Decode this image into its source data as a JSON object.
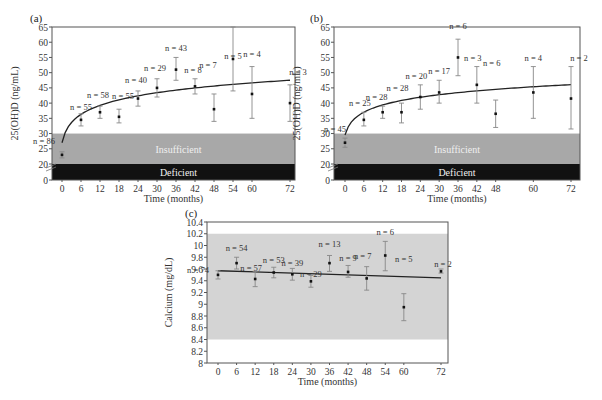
{
  "chart_data": [
    {
      "panel": "(a)",
      "type": "scatter",
      "title": "",
      "xlabel": "Time (months)",
      "ylabel": "25(OH)D (ng/mL)",
      "x_ticks": [
        0,
        6,
        12,
        18,
        24,
        30,
        36,
        42,
        48,
        54,
        60,
        72
      ],
      "y_ticks": [
        0,
        20,
        25,
        30,
        35,
        40,
        45,
        50,
        55,
        60,
        65
      ],
      "ylim": [
        0,
        65
      ],
      "axis_break": "between 0 and 20",
      "zones": [
        {
          "label": "Insufficient",
          "from": 20,
          "to": 30,
          "color": "#a8a8a8"
        },
        {
          "label": "Deficient",
          "from": 0,
          "to": 20,
          "color": "#111111"
        }
      ],
      "points": [
        {
          "x": 0,
          "y": 23,
          "low": 22,
          "high": 24,
          "n": "n = 86"
        },
        {
          "x": 6,
          "y": 34.5,
          "low": 32.5,
          "high": 36.5,
          "n": "n = 55"
        },
        {
          "x": 12,
          "y": 37,
          "low": 35,
          "high": 39,
          "n": "n = 58"
        },
        {
          "x": 18,
          "y": 35.5,
          "low": 33.5,
          "high": 38,
          "n": "n = 55"
        },
        {
          "x": 24,
          "y": 41.5,
          "low": 39,
          "high": 44,
          "n": "n = 40"
        },
        {
          "x": 30,
          "y": 45,
          "low": 42,
          "high": 48,
          "n": "n = 29"
        },
        {
          "x": 36,
          "y": 51,
          "low": 47.5,
          "high": 55,
          "n": "n = 43"
        },
        {
          "x": 42,
          "y": 45.5,
          "low": 43,
          "high": 48,
          "n": "n = 8"
        },
        {
          "x": 48,
          "y": 38,
          "low": 34,
          "high": 43,
          "n": "n = 7"
        },
        {
          "x": 54,
          "y": 54.5,
          "low": 44,
          "high": 65,
          "n": "n = 5"
        },
        {
          "x": 60,
          "y": 43,
          "low": 35,
          "high": 52,
          "n": "n = 4"
        },
        {
          "x": 72,
          "y": 40,
          "low": 34,
          "high": 46,
          "n": "n = 3"
        }
      ],
      "trend": "logarithmic curve from ~27 at 0 months to ~47.5 at 72 months"
    },
    {
      "panel": "(b)",
      "type": "scatter",
      "title": "",
      "xlabel": "Time (months)",
      "ylabel": "25(OH)D (ng/mL)",
      "x_ticks": [
        0,
        6,
        12,
        18,
        24,
        30,
        36,
        42,
        48,
        60,
        72
      ],
      "y_ticks": [
        0,
        20,
        25,
        30,
        35,
        40,
        45,
        50,
        55,
        60,
        65
      ],
      "ylim": [
        0,
        65
      ],
      "axis_break": "between 0 and 20",
      "zones": [
        {
          "label": "Insufficient",
          "from": 20,
          "to": 30,
          "color": "#a8a8a8"
        },
        {
          "label": "Deficient",
          "from": 0,
          "to": 20,
          "color": "#111111"
        }
      ],
      "points": [
        {
          "x": 0,
          "y": 27,
          "low": 25.5,
          "high": 28.5,
          "n": "n = 45"
        },
        {
          "x": 6,
          "y": 34.5,
          "low": 32.5,
          "high": 37,
          "n": "n = 25"
        },
        {
          "x": 12,
          "y": 37,
          "low": 35,
          "high": 39,
          "n": "n = 28"
        },
        {
          "x": 18,
          "y": 37,
          "low": 33.5,
          "high": 40,
          "n": "n = 28"
        },
        {
          "x": 24,
          "y": 42,
          "low": 38,
          "high": 46,
          "n": "n = 20"
        },
        {
          "x": 30,
          "y": 43.5,
          "low": 40,
          "high": 47.5,
          "n": "n = 17"
        },
        {
          "x": 36,
          "y": 55,
          "low": 49,
          "high": 61,
          "n": "n = 6"
        },
        {
          "x": 42,
          "y": 46,
          "low": 40,
          "high": 52,
          "n": "n = 3"
        },
        {
          "x": 48,
          "y": 36.5,
          "low": 32,
          "high": 41,
          "n": "n = 6"
        },
        {
          "x": 60,
          "y": 43.5,
          "low": 35,
          "high": 52,
          "n": "n = 4"
        },
        {
          "x": 72,
          "y": 41.5,
          "low": 31.5,
          "high": 52,
          "n": "n = 2"
        }
      ],
      "trend": "logarithmic curve from ~29.5 at 0 months to ~46 at 72 months"
    },
    {
      "panel": "(c)",
      "type": "scatter",
      "title": "",
      "xlabel": "Time (months)",
      "ylabel": "Calcium (mg/dL)",
      "x_ticks": [
        0,
        6,
        12,
        18,
        24,
        30,
        36,
        42,
        48,
        54,
        60,
        72
      ],
      "y_ticks": [
        8,
        8.2,
        8.4,
        8.6,
        8.8,
        9,
        9.2,
        9.4,
        9.6,
        9.8,
        10,
        10.2,
        10.4
      ],
      "ylim": [
        8,
        10.4
      ],
      "zones": [
        {
          "label": "normal range",
          "from": 8.4,
          "to": 10.2,
          "color": "#d4d4d4"
        }
      ],
      "points": [
        {
          "x": 0,
          "y": 9.5,
          "low": 9.43,
          "high": 9.57,
          "n": "n = 74"
        },
        {
          "x": 6,
          "y": 9.7,
          "low": 9.6,
          "high": 9.8,
          "n": "n = 54"
        },
        {
          "x": 12,
          "y": 9.43,
          "low": 9.3,
          "high": 9.56,
          "n": "n = 57"
        },
        {
          "x": 18,
          "y": 9.54,
          "low": 9.45,
          "high": 9.63,
          "n": "n = 53"
        },
        {
          "x": 24,
          "y": 9.51,
          "low": 9.41,
          "high": 9.61,
          "n": "n = 39"
        },
        {
          "x": 30,
          "y": 9.39,
          "low": 9.29,
          "high": 9.49,
          "n": "n = 29"
        },
        {
          "x": 36,
          "y": 9.7,
          "low": 9.56,
          "high": 9.83,
          "n": "n = 13"
        },
        {
          "x": 42,
          "y": 9.55,
          "low": 9.46,
          "high": 9.66,
          "n": "n = 9"
        },
        {
          "x": 48,
          "y": 9.44,
          "low": 9.24,
          "high": 9.64,
          "n": "n = 7"
        },
        {
          "x": 54,
          "y": 9.83,
          "low": 9.57,
          "high": 10.07,
          "n": "n = 6"
        },
        {
          "x": 60,
          "y": 8.95,
          "low": 8.72,
          "high": 9.18,
          "n": "n = 5"
        },
        {
          "x": 72,
          "y": 9.56,
          "low": 9.53,
          "high": 9.6,
          "n": "n = 2"
        }
      ],
      "trend": "linear line from ~9.57 at 0 months to ~9.45 at 72 months"
    }
  ]
}
